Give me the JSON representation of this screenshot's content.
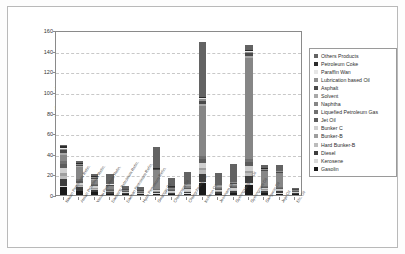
{
  "chart_data": {
    "type": "bar",
    "stacked": true,
    "title": "",
    "xlabel": "",
    "ylabel": "(million bbl.)",
    "ylim": [
      0,
      160
    ],
    "ytick_step": 20,
    "yticks": [
      160,
      140,
      120,
      100,
      80,
      60,
      40,
      20,
      0
    ],
    "grid": true,
    "legend_position": "right",
    "categories": [
      "Nasan Petroleum Refin.",
      "Ausan Petroleum Refin.",
      "Yeosu Petroleum Refin.",
      "Daesung Petroleum Refin.",
      "Daehan Petroleum Refin.",
      "Hyun Petroleum Refin.",
      "Gwangju Oil",
      "Chungnam Oil",
      "Chungcheong Oil",
      "Incheon Oil",
      "Jeonnam Oil",
      "Gyeongsangbuk Oil",
      "Gyeongnam Oil",
      "Gangwon Oil",
      "Jeju Oil",
      "Etc. Oil"
    ],
    "series": [
      {
        "name": "Gasolin",
        "color": "#1a1a1a",
        "values": [
          8.0,
          3.5,
          2.6,
          1.0,
          0.8,
          0.6,
          1.2,
          1.0,
          1.4,
          11.5,
          1.0,
          1.5,
          9.8,
          1.5,
          1.4,
          0.7
        ]
      },
      {
        "name": "Kerosene",
        "color": "#d9d9d9",
        "values": [
          1.2,
          0.8,
          0.5,
          0.3,
          0.2,
          0.2,
          0.3,
          0.3,
          0.4,
          1.6,
          0.4,
          0.5,
          1.5,
          0.5,
          0.5,
          0.2
        ]
      },
      {
        "name": "Diesel",
        "color": "#3d3d3d",
        "values": [
          6.5,
          3.0,
          2.2,
          1.2,
          0.7,
          0.6,
          1.0,
          1.0,
          1.3,
          7.5,
          1.2,
          1.6,
          6.8,
          1.8,
          1.6,
          0.8
        ]
      },
      {
        "name": "Hard Bunker-B",
        "color": "#bcbcbc",
        "values": [
          3.2,
          1.4,
          1.0,
          0.6,
          0.4,
          0.3,
          0.6,
          0.6,
          0.8,
          3.2,
          0.7,
          0.9,
          3.0,
          1.0,
          0.9,
          0.4
        ]
      },
      {
        "name": "Bunker-B",
        "color": "#9e9e9e",
        "values": [
          2.0,
          0.9,
          0.7,
          0.4,
          0.3,
          0.2,
          0.4,
          0.4,
          0.5,
          2.0,
          0.5,
          0.6,
          1.9,
          0.6,
          0.6,
          0.3
        ]
      },
      {
        "name": "Bunker C",
        "color": "#cfcfcf",
        "values": [
          5.5,
          2.4,
          1.7,
          0.9,
          0.6,
          0.5,
          1.0,
          0.9,
          1.2,
          5.4,
          1.1,
          1.4,
          5.2,
          1.5,
          1.3,
          0.6
        ]
      },
      {
        "name": "Jet Oil",
        "color": "#5c5c5c",
        "values": [
          4.0,
          1.8,
          1.3,
          0.7,
          0.5,
          0.4,
          0.8,
          0.7,
          0.9,
          4.0,
          0.9,
          1.1,
          3.8,
          1.2,
          1.0,
          0.5
        ]
      },
      {
        "name": "Liquefied Petroleum Gas",
        "color": "#707070",
        "values": [
          3.0,
          1.3,
          1.0,
          0.6,
          0.4,
          0.3,
          0.6,
          0.6,
          0.7,
          3.0,
          0.7,
          0.8,
          2.8,
          0.9,
          0.8,
          0.4
        ]
      },
      {
        "name": "Naphtha",
        "color": "#868686",
        "values": [
          5.0,
          12.0,
          4.0,
          3.0,
          1.0,
          1.0,
          18.0,
          1.2,
          1.5,
          48.0,
          1.4,
          1.8,
          98.0,
          14.0,
          13.0,
          1.0
        ]
      },
      {
        "name": "Solvent",
        "color": "#a8a8a8",
        "values": [
          2.2,
          1.0,
          0.8,
          0.5,
          0.3,
          0.3,
          0.5,
          0.5,
          0.6,
          2.2,
          0.6,
          0.7,
          2.1,
          0.7,
          0.6,
          0.3
        ]
      },
      {
        "name": "Asphalt",
        "color": "#4a4a4a",
        "values": [
          2.6,
          1.1,
          0.9,
          0.5,
          0.3,
          0.3,
          0.6,
          0.5,
          0.7,
          2.6,
          0.6,
          0.8,
          2.4,
          0.8,
          0.7,
          0.3
        ]
      },
      {
        "name": "Lubrication based Oil",
        "color": "#8f8f8f",
        "values": [
          1.8,
          0.8,
          0.6,
          0.4,
          0.2,
          0.2,
          0.4,
          0.4,
          0.5,
          1.8,
          0.4,
          0.6,
          1.7,
          0.6,
          0.5,
          0.2
        ]
      },
      {
        "name": "Paraffin Wax",
        "color": "#e6e6e6",
        "values": [
          0.9,
          0.4,
          0.3,
          0.2,
          0.1,
          0.1,
          0.2,
          0.2,
          0.3,
          0.9,
          0.2,
          0.3,
          0.8,
          0.3,
          0.3,
          0.1
        ]
      },
      {
        "name": "Petroleum Coke",
        "color": "#2b2b2b",
        "values": [
          1.4,
          0.6,
          0.5,
          0.3,
          0.2,
          0.2,
          0.3,
          0.3,
          0.4,
          1.4,
          0.4,
          0.5,
          1.3,
          0.5,
          0.4,
          0.2
        ]
      },
      {
        "name": "Others Products",
        "color": "#636363",
        "values": [
          1.2,
          2.0,
          1.9,
          9.4,
          3.0,
          2.9,
          20.5,
          8.4,
          10.8,
          52.9,
          10.9,
          16.9,
          4.9,
          3.1,
          5.4,
          1.0
        ]
      }
    ]
  },
  "legend": {
    "items": [
      {
        "label": "Others Products",
        "color": "#636363"
      },
      {
        "label": "Petroleum Coke",
        "color": "#2b2b2b"
      },
      {
        "label": "Paraffin Wan",
        "color": "#e6e6e6"
      },
      {
        "label": "Lubrication based Oil",
        "color": "#8f8f8f"
      },
      {
        "label": "Asphalt",
        "color": "#4a4a4a"
      },
      {
        "label": "Solvent",
        "color": "#a8a8a8"
      },
      {
        "label": "Naphtha",
        "color": "#868686"
      },
      {
        "label": "Liquefied Petroleum Gas",
        "color": "#707070"
      },
      {
        "label": "Jet Oil",
        "color": "#5c5c5c"
      },
      {
        "label": "Bunker C",
        "color": "#cfcfcf"
      },
      {
        "label": "Bunker-B",
        "color": "#9e9e9e"
      },
      {
        "label": "Hard Bunker-B",
        "color": "#bcbcbc"
      },
      {
        "label": "Diesel",
        "color": "#3d3d3d"
      },
      {
        "label": "Kerosene",
        "color": "#d9d9d9"
      },
      {
        "label": "Gasolin",
        "color": "#1a1a1a"
      }
    ]
  }
}
